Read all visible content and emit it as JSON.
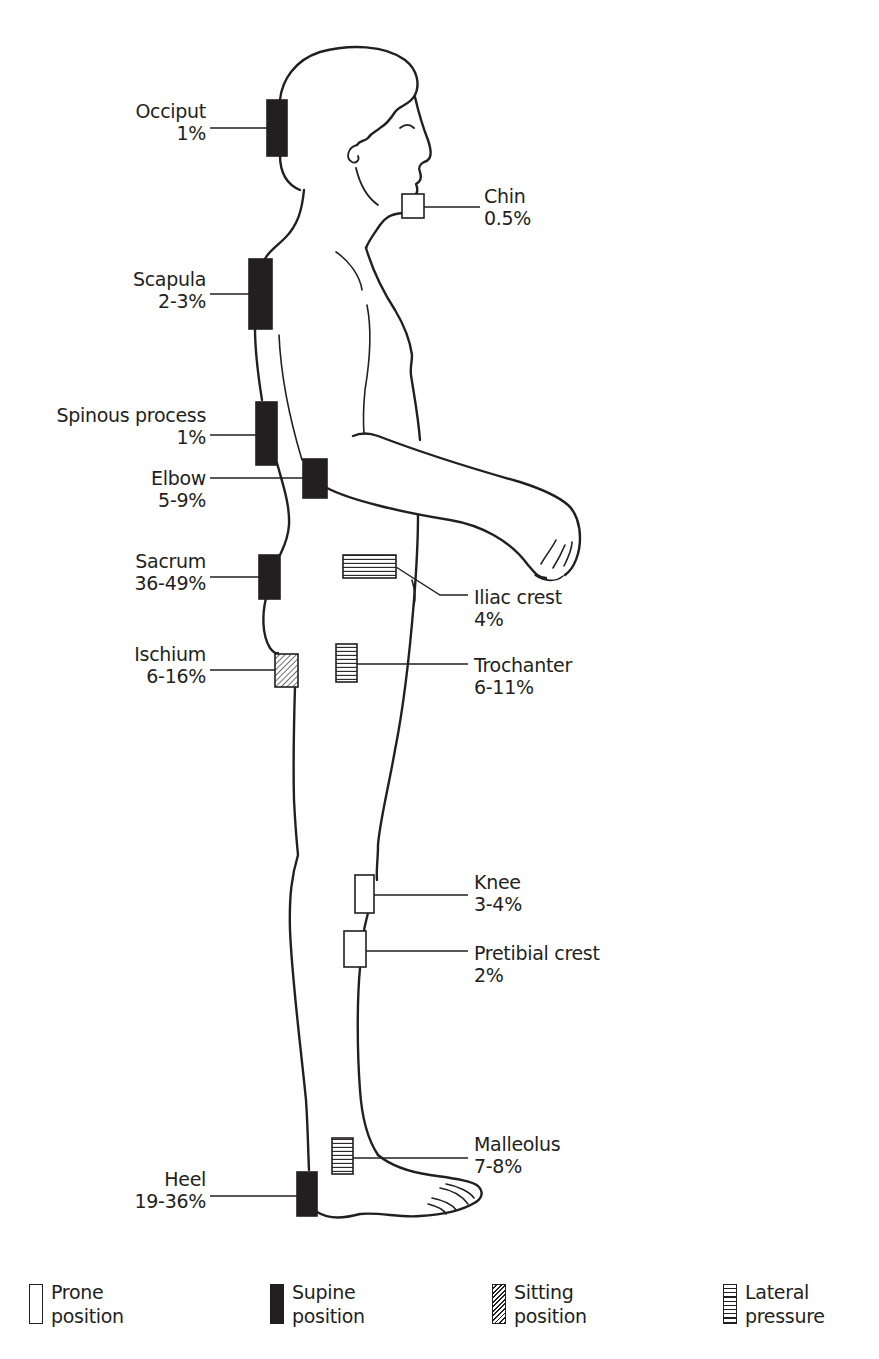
{
  "diagram": {
    "type": "pressure-ulcer-sites",
    "figure": "side-view standing human figure with marked pressure points"
  },
  "colors": {
    "ink": "#231f20",
    "background": "#ffffff"
  },
  "sites": [
    {
      "id": "occiput",
      "name": "Occiput",
      "value": "1%",
      "position": "supine",
      "side": "left"
    },
    {
      "id": "chin",
      "name": "Chin",
      "value": "0.5%",
      "position": "prone",
      "side": "right"
    },
    {
      "id": "scapula",
      "name": "Scapula",
      "value": "2-3%",
      "position": "supine",
      "side": "left"
    },
    {
      "id": "spinous-process",
      "name": "Spinous process",
      "value": "1%",
      "position": "supine",
      "side": "left"
    },
    {
      "id": "elbow",
      "name": "Elbow",
      "value": "5-9%",
      "position": "supine",
      "side": "left"
    },
    {
      "id": "sacrum",
      "name": "Sacrum",
      "value": "36-49%",
      "position": "supine",
      "side": "left"
    },
    {
      "id": "iliac-crest",
      "name": "Iliac crest",
      "value": "4%",
      "position": "lateral",
      "side": "right"
    },
    {
      "id": "ischium",
      "name": "Ischium",
      "value": "6-16%",
      "position": "sitting",
      "side": "left"
    },
    {
      "id": "trochanter",
      "name": "Trochanter",
      "value": "6-11%",
      "position": "lateral",
      "side": "right"
    },
    {
      "id": "knee",
      "name": "Knee",
      "value": "3-4%",
      "position": "prone",
      "side": "right"
    },
    {
      "id": "pretibial-crest",
      "name": "Pretibial crest",
      "value": "2%",
      "position": "prone",
      "side": "right"
    },
    {
      "id": "malleolus",
      "name": "Malleolus",
      "value": "7-8%",
      "position": "lateral",
      "side": "right"
    },
    {
      "id": "heel",
      "name": "Heel",
      "value": "19-36%",
      "position": "supine",
      "side": "left"
    }
  ],
  "legend": [
    {
      "key": "prone",
      "line1": "Prone",
      "line2": "position"
    },
    {
      "key": "supine",
      "line1": "Supine",
      "line2": "position"
    },
    {
      "key": "sitting",
      "line1": "Sitting",
      "line2": "position"
    },
    {
      "key": "lateral",
      "line1": "Lateral",
      "line2": "pressure"
    }
  ]
}
